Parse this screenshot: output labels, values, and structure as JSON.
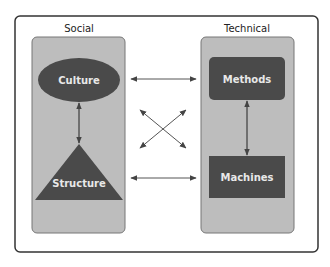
{
  "diagram": {
    "groups": [
      {
        "id": "social",
        "label": "Social"
      },
      {
        "id": "technical",
        "label": "Technical"
      }
    ],
    "nodes": [
      {
        "id": "culture",
        "label": "Culture",
        "shape": "ellipse",
        "group": "social"
      },
      {
        "id": "structure",
        "label": "Structure",
        "shape": "triangle",
        "group": "social"
      },
      {
        "id": "methods",
        "label": "Methods",
        "shape": "rounded-rect",
        "group": "technical"
      },
      {
        "id": "machines",
        "label": "Machines",
        "shape": "rect",
        "group": "technical"
      }
    ],
    "edges": [
      {
        "from": "culture",
        "to": "structure",
        "bidirectional": true
      },
      {
        "from": "methods",
        "to": "machines",
        "bidirectional": true
      },
      {
        "from": "culture",
        "to": "methods",
        "bidirectional": true
      },
      {
        "from": "structure",
        "to": "machines",
        "bidirectional": true
      },
      {
        "from": "culture",
        "to": "machines",
        "bidirectional": true
      },
      {
        "from": "structure",
        "to": "methods",
        "bidirectional": true
      }
    ]
  },
  "colors": {
    "frame": "#333333",
    "panel": "#bdbdbd",
    "node": "#4a4a4a",
    "arrow": "#555555"
  }
}
